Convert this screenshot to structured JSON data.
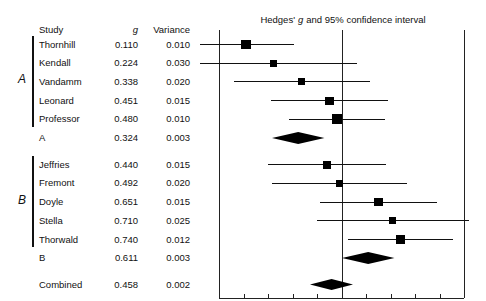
{
  "table": {
    "headers": {
      "study": "Study",
      "g": "g",
      "variance": "Variance"
    },
    "groups": [
      {
        "label": "A",
        "rows": [
          {
            "study": "Thornhill",
            "g": "0.110",
            "variance": "0.010",
            "g_val": 0.11,
            "var_val": 0.01,
            "type": "study"
          },
          {
            "study": "Kendall",
            "g": "0.224",
            "variance": "0.030",
            "g_val": 0.224,
            "var_val": 0.03,
            "type": "study"
          },
          {
            "study": "Vandamm",
            "g": "0.338",
            "variance": "0.020",
            "g_val": 0.338,
            "var_val": 0.02,
            "type": "study"
          },
          {
            "study": "Leonard",
            "g": "0.451",
            "variance": "0.015",
            "g_val": 0.451,
            "var_val": 0.015,
            "type": "study"
          },
          {
            "study": "Professor",
            "g": "0.480",
            "variance": "0.010",
            "g_val": 0.48,
            "var_val": 0.01,
            "type": "study"
          },
          {
            "study": "A",
            "g": "0.324",
            "variance": "0.003",
            "g_val": 0.324,
            "var_val": 0.003,
            "type": "subtotal"
          }
        ]
      },
      {
        "label": "B",
        "rows": [
          {
            "study": "Jeffries",
            "g": "0.440",
            "variance": "0.015",
            "g_val": 0.44,
            "var_val": 0.015,
            "type": "study"
          },
          {
            "study": "Fremont",
            "g": "0.492",
            "variance": "0.020",
            "g_val": 0.492,
            "var_val": 0.02,
            "type": "study"
          },
          {
            "study": "Doyle",
            "g": "0.651",
            "variance": "0.015",
            "g_val": 0.651,
            "var_val": 0.015,
            "type": "study"
          },
          {
            "study": "Stella",
            "g": "0.710",
            "variance": "0.025",
            "g_val": 0.71,
            "var_val": 0.025,
            "type": "study"
          },
          {
            "study": "Thorwald",
            "g": "0.740",
            "variance": "0.012",
            "g_val": 0.74,
            "var_val": 0.012,
            "type": "study"
          },
          {
            "study": "B",
            "g": "0.611",
            "variance": "0.003",
            "g_val": 0.611,
            "var_val": 0.003,
            "type": "subtotal"
          }
        ]
      }
    ],
    "combined": {
      "study": "Combined",
      "g": "0.458",
      "variance": "0.002",
      "g_val": 0.458,
      "var_val": 0.002,
      "type": "combined"
    }
  },
  "chart_data": {
    "type": "forest",
    "title_pre": "Hedges'",
    "title_italic": "g",
    "title_post": "and 95% confidence interval",
    "xlabel": "",
    "ylabel": "",
    "xlim": [
      0.0,
      1.0
    ],
    "xticks": [
      0.0,
      0.1,
      0.2,
      0.3,
      0.4,
      0.5,
      0.6,
      0.7,
      0.8,
      0.9,
      1.0
    ],
    "xticklabels": [
      "0.0",
      "0.1",
      "0.2",
      "0.3",
      "0.4",
      "0.5",
      "0.6",
      "0.7",
      "0.8",
      "0.9",
      "1.0"
    ],
    "reference_lines": [
      0.0,
      0.5
    ],
    "grid": false,
    "legend": null,
    "effect_measure": "Hedges' g",
    "ci_level": "95%",
    "marker_colors": {
      "point": "#000000",
      "diamond": "#000000",
      "line": "#111111",
      "axis": "#222222"
    },
    "points": [
      {
        "label": "Thornhill",
        "g": 0.11,
        "variance": 0.01,
        "ci_low": -0.086,
        "ci_high": 0.306,
        "kind": "study"
      },
      {
        "label": "Kendall",
        "g": 0.224,
        "variance": 0.03,
        "ci_low": -0.115,
        "ci_high": 0.563,
        "kind": "study"
      },
      {
        "label": "Vandamm",
        "g": 0.338,
        "variance": 0.02,
        "ci_low": 0.061,
        "ci_high": 0.615,
        "kind": "study"
      },
      {
        "label": "Leonard",
        "g": 0.451,
        "variance": 0.015,
        "ci_low": 0.211,
        "ci_high": 0.691,
        "kind": "study"
      },
      {
        "label": "Professor",
        "g": 0.48,
        "variance": 0.01,
        "ci_low": 0.284,
        "ci_high": 0.676,
        "kind": "study"
      },
      {
        "label": "A",
        "g": 0.324,
        "variance": 0.003,
        "ci_low": 0.217,
        "ci_high": 0.431,
        "kind": "subtotal"
      },
      {
        "label": "Jeffries",
        "g": 0.44,
        "variance": 0.015,
        "ci_low": 0.2,
        "ci_high": 0.68,
        "kind": "study"
      },
      {
        "label": "Fremont",
        "g": 0.492,
        "variance": 0.02,
        "ci_low": 0.215,
        "ci_high": 0.769,
        "kind": "study"
      },
      {
        "label": "Doyle",
        "g": 0.651,
        "variance": 0.015,
        "ci_low": 0.411,
        "ci_high": 0.891,
        "kind": "study"
      },
      {
        "label": "Stella",
        "g": 0.71,
        "variance": 0.025,
        "ci_low": 0.4,
        "ci_high": 1.02,
        "kind": "study"
      },
      {
        "label": "Thorwald",
        "g": 0.74,
        "variance": 0.012,
        "ci_low": 0.525,
        "ci_high": 0.955,
        "kind": "study"
      },
      {
        "label": "B",
        "g": 0.611,
        "variance": 0.003,
        "ci_low": 0.504,
        "ci_high": 0.718,
        "kind": "subtotal"
      },
      {
        "label": "Combined",
        "g": 0.458,
        "variance": 0.002,
        "ci_low": 0.37,
        "ci_high": 0.546,
        "kind": "combined"
      }
    ]
  }
}
